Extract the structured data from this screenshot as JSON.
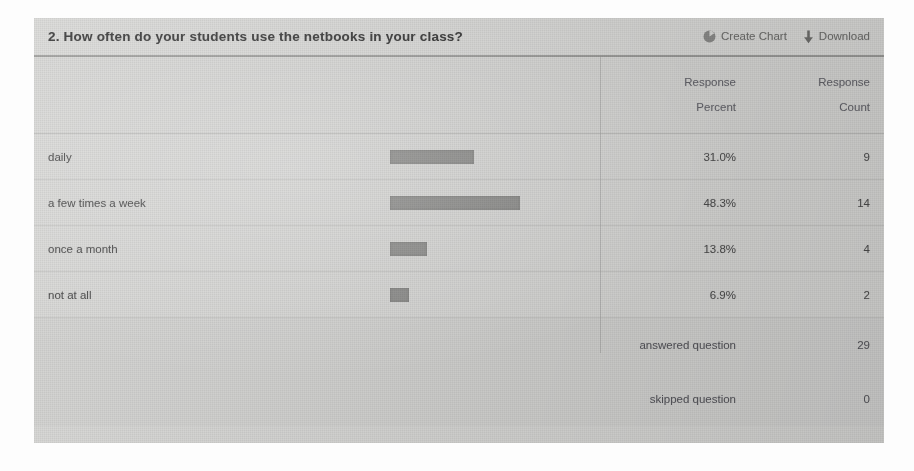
{
  "header": {
    "question_number": "2.",
    "question_title": "2. How often do your students use the netbooks in your class?",
    "create_chart_label": "Create Chart",
    "create_chart_icon": "pie-chart-icon",
    "download_label": "Download",
    "download_icon": "download-arrow-icon"
  },
  "columns": {
    "answer_header": "",
    "percent_header_line1": "Response",
    "percent_header_line2": "Percent",
    "count_header_line1": "Response",
    "count_header_line2": "Count"
  },
  "rows": [
    {
      "label": "daily",
      "percent": "31.0%",
      "percent_value": 31.0,
      "count": "9"
    },
    {
      "label": "a few times a week",
      "percent": "48.3%",
      "percent_value": 48.3,
      "count": "14"
    },
    {
      "label": "once a month",
      "percent": "13.8%",
      "percent_value": 13.8,
      "count": "4"
    },
    {
      "label": "not at all",
      "percent": "6.9%",
      "percent_value": 6.9,
      "count": "2"
    }
  ],
  "footer": [
    {
      "label": "answered question",
      "value": "29"
    },
    {
      "label": "skipped question",
      "value": "0"
    }
  ],
  "colors": {
    "table_background": "#d6d6d4",
    "bar_fill": "#8a8a88",
    "header_rule": "#9a9a98",
    "row_rule": "#c4c4c2",
    "title_text": "#2f2f2f",
    "body_text": "#4c4c4c",
    "muted_text": "#63636a"
  },
  "chart_data": {
    "type": "bar",
    "title": "2. How often do your students use the netbooks in your class?",
    "orientation": "horizontal",
    "categories": [
      "daily",
      "a few times a week",
      "once a month",
      "not at all"
    ],
    "values": [
      31.0,
      48.3,
      13.8,
      6.9
    ],
    "counts": [
      9,
      14,
      4,
      2
    ],
    "xlabel": "Response Percent",
    "ylabel": "",
    "xlim": [
      0,
      100
    ],
    "grid": false,
    "legend": "none",
    "answered_question": 29,
    "skipped_question": 0
  }
}
